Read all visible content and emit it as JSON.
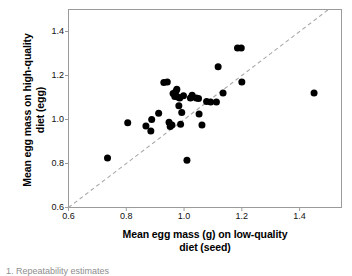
{
  "figure": {
    "type": "scatter-plot",
    "background_color": "#ffffff",
    "point_color": "#000000",
    "axis_color": "#9a9a9a",
    "reference_line_color": "#a8a8a8",
    "caption_partial": "1. Repeatability estimates"
  },
  "chart_data": {
    "type": "scatter",
    "title": "",
    "xlabel": "Mean egg mass (g) on low-quality\ndiet (seed)",
    "ylabel": "Mean egg mass on high-quality\ndiet (egg)",
    "xlim": [
      0.6,
      1.545
    ],
    "ylim": [
      0.6,
      1.5
    ],
    "xticks": [
      0.6,
      0.8,
      1.0,
      1.2,
      1.4
    ],
    "yticks": [
      0.6,
      0.8,
      1.0,
      1.2,
      1.4
    ],
    "xtick_labels": [
      "0.6",
      "0.8",
      "1.0",
      "1.2",
      "1.4"
    ],
    "ytick_labels": [
      "0.6",
      "0.8",
      "1.0",
      "1.2",
      "1.4"
    ],
    "grid": false,
    "legend": null,
    "annotations": [
      {
        "name": "one-to-one-line",
        "kind": "dashed-reference-line",
        "from": [
          0.6,
          0.6
        ],
        "to": [
          1.5,
          1.5
        ],
        "style": "dashed"
      }
    ],
    "series": [
      {
        "name": "Mean egg mass per female",
        "marker": "filled-circle",
        "color": "#000000",
        "points": [
          [
            0.735,
            0.825
          ],
          [
            0.805,
            0.985
          ],
          [
            0.868,
            0.97
          ],
          [
            0.885,
            0.948
          ],
          [
            0.888,
            1.0
          ],
          [
            0.912,
            1.028
          ],
          [
            0.93,
            1.168
          ],
          [
            0.942,
            1.17
          ],
          [
            0.948,
            0.988
          ],
          [
            0.952,
            0.968
          ],
          [
            0.958,
            0.975
          ],
          [
            0.962,
            1.118
          ],
          [
            0.968,
            1.105
          ],
          [
            0.972,
            1.128
          ],
          [
            0.975,
            1.138
          ],
          [
            0.978,
            1.102
          ],
          [
            0.982,
            1.062
          ],
          [
            0.985,
            1.098
          ],
          [
            0.988,
            0.978
          ],
          [
            0.992,
            1.032
          ],
          [
            0.998,
            1.108
          ],
          [
            1.01,
            0.815
          ],
          [
            1.022,
            1.098
          ],
          [
            1.028,
            1.11
          ],
          [
            1.042,
            1.098
          ],
          [
            1.05,
            1.095
          ],
          [
            1.052,
            1.025
          ],
          [
            1.062,
            0.975
          ],
          [
            1.078,
            1.082
          ],
          [
            1.092,
            1.08
          ],
          [
            1.112,
            1.08
          ],
          [
            1.118,
            1.24
          ],
          [
            1.135,
            1.12
          ],
          [
            1.185,
            1.325
          ],
          [
            1.198,
            1.325
          ],
          [
            1.2,
            1.17
          ],
          [
            1.45,
            1.12
          ]
        ]
      }
    ]
  }
}
